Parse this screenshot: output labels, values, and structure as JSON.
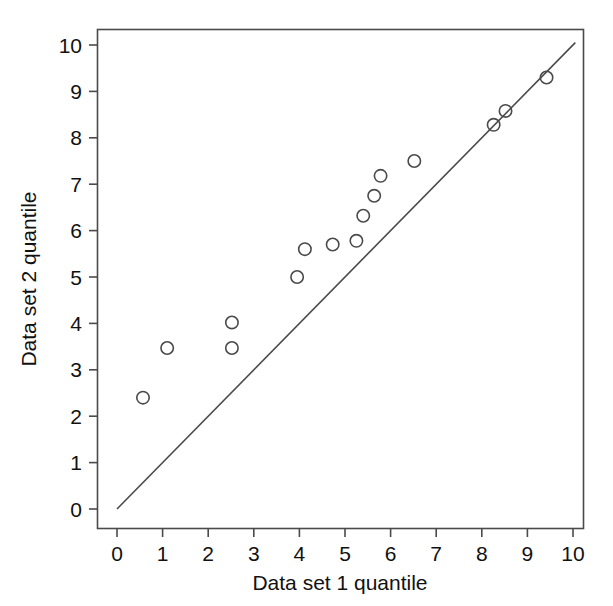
{
  "chart_data": {
    "type": "scatter",
    "title": "",
    "subtitle": "",
    "xlabel": "Data set 1 quantile",
    "ylabel": "Data set 2 quantile",
    "xlim": [
      0,
      10.4
    ],
    "ylim": [
      0,
      10.4
    ],
    "xticks": [
      0,
      1,
      2,
      3,
      4,
      5,
      6,
      7,
      8,
      9,
      10
    ],
    "yticks": [
      0,
      1,
      2,
      3,
      4,
      5,
      6,
      7,
      8,
      9,
      10
    ],
    "xtick_labels": [
      "0",
      "1",
      "2",
      "3",
      "4",
      "5",
      "6",
      "7",
      "8",
      "9",
      "10"
    ],
    "ytick_labels": [
      "0",
      "1",
      "2",
      "3",
      "4",
      "5",
      "6",
      "7",
      "8",
      "9",
      "10"
    ],
    "grid": false,
    "legend": false,
    "legend_position": "none",
    "marker_style": "open-circle",
    "marker_color": "#4a4a4a",
    "line_color": "#4a4a4a",
    "background_color": "#ffffff",
    "series": [
      {
        "name": "quantile pairs",
        "type": "scatter",
        "points": [
          {
            "x": 0.57,
            "y": 2.4
          },
          {
            "x": 1.1,
            "y": 3.47
          },
          {
            "x": 2.52,
            "y": 4.02
          },
          {
            "x": 2.52,
            "y": 3.47
          },
          {
            "x": 3.95,
            "y": 5.0
          },
          {
            "x": 4.12,
            "y": 5.6
          },
          {
            "x": 4.73,
            "y": 5.7
          },
          {
            "x": 5.25,
            "y": 5.78
          },
          {
            "x": 5.4,
            "y": 6.32
          },
          {
            "x": 5.64,
            "y": 6.75
          },
          {
            "x": 5.78,
            "y": 7.18
          },
          {
            "x": 6.52,
            "y": 7.5
          },
          {
            "x": 8.26,
            "y": 8.28
          },
          {
            "x": 8.52,
            "y": 8.58
          },
          {
            "x": 9.42,
            "y": 9.3
          }
        ]
      },
      {
        "name": "reference line y = x",
        "type": "line",
        "x_start": 0.0,
        "y_start": 0.0,
        "x_end": 10.05,
        "y_end": 10.05
      }
    ]
  },
  "axes": {
    "x_axis_title": "Data set 1 quantile",
    "y_axis_title": "Data set 2 quantile"
  }
}
